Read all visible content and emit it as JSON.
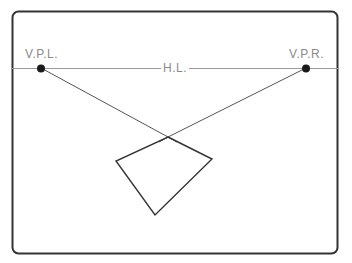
{
  "diagram": {
    "labels": {
      "vanishing_point_left": "V.P.L.",
      "vanishing_point_right": "V.P.R.",
      "horizon_line": "H.L."
    },
    "colors": {
      "frame": "#333333",
      "horizon": "#9a9a9a",
      "guide_lines": "#555555",
      "shape": "#333333",
      "points": "#1a1a1a",
      "label_text": "#8a8a8a",
      "background": "#ffffff"
    },
    "frame": {
      "x": 12,
      "y": 11,
      "width": 326,
      "height": 243,
      "corner_radius": 6
    },
    "horizon_y": 68,
    "vanishing_points": [
      {
        "name": "V.P.L.",
        "x": 41,
        "y": 68
      },
      {
        "name": "V.P.R.",
        "x": 306,
        "y": 68
      }
    ],
    "shape_vertices": [
      {
        "name": "top",
        "x": 168,
        "y": 137
      },
      {
        "name": "right",
        "x": 212,
        "y": 159
      },
      {
        "name": "bottom",
        "x": 155,
        "y": 215
      },
      {
        "name": "left",
        "x": 116,
        "y": 161
      }
    ]
  }
}
